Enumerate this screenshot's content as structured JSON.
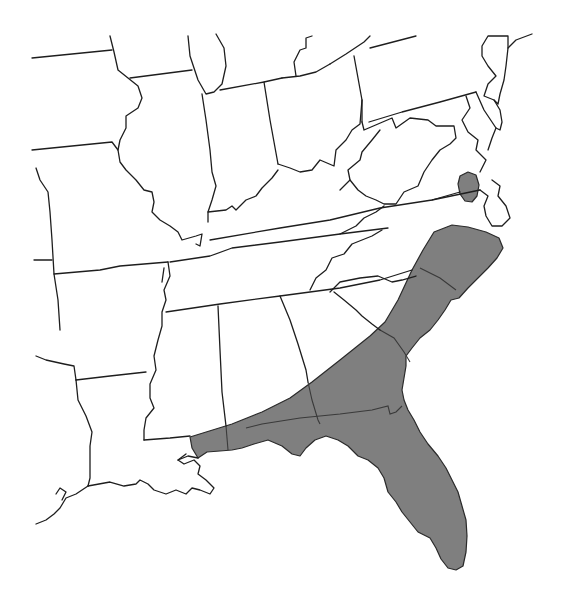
{
  "map": {
    "type": "species-range-map",
    "region": "Southeastern United States",
    "background_color": "#ffffff",
    "border_color": "#1e1e1e",
    "range_fill_color": "#7f7f7f",
    "shaded_range": {
      "label": "range",
      "states": [
        "Florida",
        "Georgia (coastal plain)",
        "South Carolina (coastal plain)",
        "North Carolina (coastal plain)",
        "Alabama (southern)",
        "Mississippi (southern coast)",
        "Virginia (southeastern tip)"
      ]
    },
    "states_outlined": [
      "Iowa",
      "Missouri",
      "Illinois",
      "Indiana",
      "Ohio",
      "Kentucky",
      "West Virginia",
      "Virginia",
      "Pennsylvania",
      "New Jersey",
      "Maryland",
      "Delaware",
      "Tennessee",
      "North Carolina",
      "South Carolina",
      "Georgia",
      "Alabama",
      "Mississippi",
      "Arkansas",
      "Louisiana",
      "Texas",
      "Oklahoma",
      "Michigan",
      "Wisconsin",
      "New York"
    ]
  }
}
